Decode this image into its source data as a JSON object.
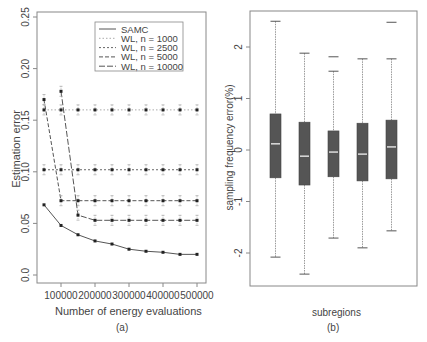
{
  "chart_data": [
    {
      "panel": "(a)",
      "type": "line",
      "title": "",
      "xlabel": "Number of energy evaluations",
      "ylabel": "Estimation error",
      "caption": "(a)",
      "x": [
        50000,
        100000,
        150000,
        200000,
        250000,
        300000,
        350000,
        400000,
        450000,
        500000
      ],
      "xticks": [
        "100000",
        "200000",
        "300000",
        "400000",
        "500000"
      ],
      "xtick_values": [
        100000,
        200000,
        300000,
        400000,
        500000
      ],
      "yticks": [
        "0.0",
        "0.05",
        "0.10",
        "0.15",
        "0.20",
        "0.25"
      ],
      "ytick_values": [
        0.0,
        0.05,
        0.1,
        0.15,
        0.2,
        0.25
      ],
      "ylim": [
        0.0,
        0.25
      ],
      "xlim": [
        50000,
        500000
      ],
      "grid": false,
      "legend_position": "top-right",
      "series": [
        {
          "name": "SAMC",
          "style": "solid",
          "values": [
            0.068,
            0.048,
            0.039,
            0.033,
            0.03,
            0.025,
            0.023,
            0.022,
            0.02,
            0.02
          ]
        },
        {
          "name": "WL, n = 1000",
          "style": "dotted",
          "values": [
            0.16,
            0.16,
            0.16,
            0.16,
            0.16,
            0.16,
            0.16,
            0.16,
            0.16,
            0.16
          ]
        },
        {
          "name": "WL, n = 2500",
          "style": "dashed-short",
          "values": [
            0.102,
            0.102,
            0.102,
            0.102,
            0.102,
            0.102,
            0.102,
            0.102,
            0.102,
            0.102
          ]
        },
        {
          "name": "WL, n = 5000",
          "style": "dashed",
          "values": [
            0.17,
            0.072,
            0.072,
            0.072,
            0.072,
            0.072,
            0.072,
            0.072,
            0.072,
            0.072
          ]
        },
        {
          "name": "WL, n = 10000",
          "style": "dashed-long",
          "values": [
            null,
            0.178,
            0.058,
            0.053,
            0.053,
            0.053,
            0.053,
            0.053,
            0.053,
            0.053
          ]
        }
      ]
    },
    {
      "panel": "(b)",
      "type": "box",
      "title": "",
      "xlabel": "subregions",
      "ylabel": "sampling frequency error(%)",
      "caption": "(b)",
      "yticks": [
        "-2",
        "-1",
        "0",
        "1",
        "2"
      ],
      "ytick_values": [
        -2,
        -1,
        0,
        1,
        2
      ],
      "ylim": [
        -2.6,
        2.7
      ],
      "grid": false,
      "boxes": [
        {
          "min": -2.08,
          "q1": -0.54,
          "median": 0.12,
          "q3": 0.7,
          "max": 2.5,
          "outliers": []
        },
        {
          "min": -2.41,
          "q1": -0.68,
          "median": -0.12,
          "q3": 0.54,
          "max": 1.88,
          "outliers": []
        },
        {
          "min": -1.71,
          "q1": -0.52,
          "median": -0.04,
          "q3": 0.37,
          "max": 1.53,
          "outliers": [
            1.81
          ]
        },
        {
          "min": -1.9,
          "q1": -0.6,
          "median": -0.08,
          "q3": 0.52,
          "max": 1.77,
          "outliers": []
        },
        {
          "min": -1.57,
          "q1": -0.56,
          "median": 0.06,
          "q3": 0.58,
          "max": 1.77,
          "outliers": [
            2.48
          ]
        }
      ]
    }
  ]
}
